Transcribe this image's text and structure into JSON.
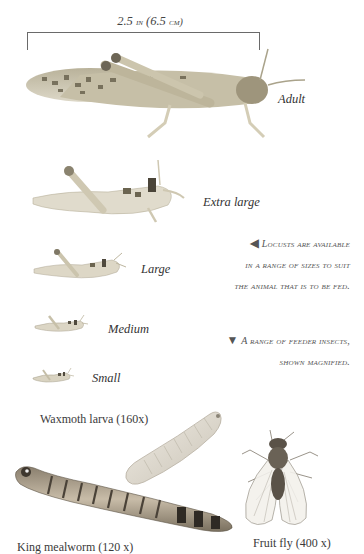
{
  "measurement": {
    "label_number": "2.5",
    "label_unit_in": "in",
    "label_metric": "(6.5",
    "label_unit_cm": "cm)"
  },
  "locust_sizes": [
    {
      "label": "Adult",
      "icon": "adult-locust-illustration"
    },
    {
      "label": "Extra large",
      "icon": "extra-large-locust-illustration"
    },
    {
      "label": "Large",
      "icon": "large-locust-illustration"
    },
    {
      "label": "Medium",
      "icon": "medium-locust-illustration"
    },
    {
      "label": "Small",
      "icon": "small-locust-illustration"
    }
  ],
  "captions": {
    "locusts": {
      "arrow": "◀",
      "lines": [
        "Locusts are available",
        "in a range of sizes to suit",
        "the animal that is to be fed."
      ]
    },
    "feeders": {
      "arrow": "▼",
      "lines": [
        "A range of feeder insects,",
        "shown magnified."
      ]
    }
  },
  "feeder_insects": [
    {
      "label": "Waxmoth larva (160x)",
      "icon": "waxmoth-larva-illustration"
    },
    {
      "label": "King mealworm (120 x)",
      "icon": "king-mealworm-illustration"
    },
    {
      "label": "Fruit fly (400 x)",
      "icon": "fruit-fly-illustration"
    }
  ],
  "colors": {
    "text": "#3a3a3a",
    "caption": "#555555",
    "locust_body": "#c9c0a6",
    "locust_spots": "#6b6450",
    "mealworm_body": "#a89a84",
    "mealworm_bands": "#4a4238",
    "waxmoth_body": "#e2ddd2",
    "fly_body": "#5a5248"
  }
}
